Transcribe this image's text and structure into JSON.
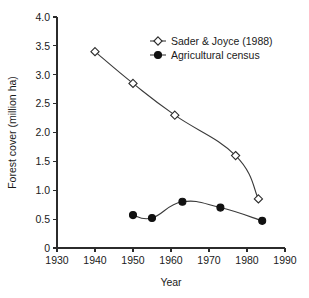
{
  "chart_data": {
    "type": "line",
    "title": "",
    "xlabel": "Year",
    "ylabel": "Forest cover (million ha)",
    "xlim": [
      1930,
      1990
    ],
    "ylim": [
      0,
      4.0
    ],
    "xticks": [
      1930,
      1940,
      1950,
      1960,
      1970,
      1980,
      1990
    ],
    "xticklabels": [
      "1930",
      "1940",
      "1950",
      "1960",
      "1970",
      "1980",
      "1990"
    ],
    "yticks": [
      0,
      0.5,
      1.0,
      1.5,
      2.0,
      2.5,
      3.0,
      3.5,
      4.0
    ],
    "yticklabels": [
      "0",
      "0.5",
      "1.0",
      "1.5",
      "2.0",
      "2.5",
      "3.0",
      "3.5",
      "4.0"
    ],
    "grid": false,
    "legend_position": "upper-right-inside",
    "line_color": "#3a3a3a",
    "series": [
      {
        "name": "Sader & Joyce (1988)",
        "marker": "open-diamond",
        "marker_fill": "#ffffff",
        "marker_edge": "#2b2b2b",
        "x": [
          1940,
          1950,
          1961,
          1977,
          1983
        ],
        "values": [
          3.4,
          2.85,
          2.3,
          1.6,
          0.85
        ]
      },
      {
        "name": "Agricultural census",
        "marker": "filled-circle",
        "marker_fill": "#111111",
        "marker_edge": "#111111",
        "x": [
          1950,
          1955,
          1963,
          1973,
          1984
        ],
        "values": [
          0.57,
          0.52,
          0.8,
          0.7,
          0.47
        ]
      }
    ]
  },
  "legend": {
    "entries": [
      {
        "label": "Sader & Joyce (1988)"
      },
      {
        "label": "Agricultural census"
      }
    ]
  },
  "axes": {
    "x_title": "Year",
    "y_title": "Forest cover (million ha)"
  }
}
